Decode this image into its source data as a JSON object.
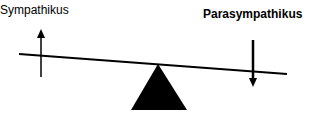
{
  "diagram": {
    "type": "seesaw-balance",
    "left_label": "Sympathikus",
    "right_label": "Parasympathikus",
    "left_arrow": "up",
    "right_arrow": "down",
    "colors": {
      "foreground": "#000000",
      "background": "#ffffff"
    }
  }
}
